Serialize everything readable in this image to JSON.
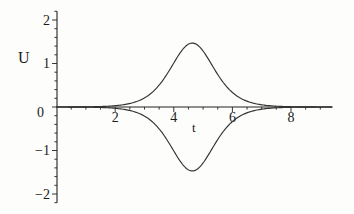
{
  "figure": {
    "background_color": "#fdfdfc",
    "curve_color": "#333333",
    "axis_color": "#222222",
    "text_color": "#1b1b1b"
  },
  "chart_data": {
    "type": "line",
    "title": "",
    "xlabel": "t",
    "ylabel": "U",
    "xlim": [
      0,
      9.4
    ],
    "ylim": [
      -2.2,
      2.2
    ],
    "x_major_ticks": [
      2,
      4,
      6,
      8
    ],
    "y_major_ticks": [
      -2,
      -1,
      0,
      1,
      2
    ],
    "x_minor_step": 0.5,
    "y_minor_step": 0.2,
    "grid": false,
    "legend": "none",
    "series": [
      {
        "name": "upper-pulse",
        "shape": "sech-squared",
        "amplitude": 1.47,
        "center": 4.63,
        "width": 1.0,
        "points": [
          [
            0,
            0.001
          ],
          [
            1,
            0.004
          ],
          [
            2,
            0.03
          ],
          [
            2.5,
            0.081
          ],
          [
            3,
            0.209
          ],
          [
            3.5,
            0.503
          ],
          [
            4,
            1.012
          ],
          [
            4.63,
            1.47
          ],
          [
            5,
            1.285
          ],
          [
            5.5,
            0.747
          ],
          [
            6,
            0.335
          ],
          [
            6.5,
            0.133
          ],
          [
            7,
            0.051
          ],
          [
            7.5,
            0.019
          ],
          [
            8,
            0.007
          ],
          [
            9,
            0.001
          ],
          [
            9.4,
            0.0
          ]
        ]
      },
      {
        "name": "lower-pulse",
        "shape": "sech-squared",
        "amplitude": -1.47,
        "center": 4.63,
        "width": 1.0,
        "points": [
          [
            0,
            -0.001
          ],
          [
            1,
            -0.004
          ],
          [
            2,
            -0.03
          ],
          [
            2.5,
            -0.081
          ],
          [
            3,
            -0.209
          ],
          [
            3.5,
            -0.503
          ],
          [
            4,
            -1.012
          ],
          [
            4.63,
            -1.47
          ],
          [
            5,
            -1.285
          ],
          [
            5.5,
            -0.747
          ],
          [
            6,
            -0.335
          ],
          [
            6.5,
            -0.133
          ],
          [
            7,
            -0.051
          ],
          [
            7.5,
            -0.019
          ],
          [
            8,
            -0.007
          ],
          [
            9,
            -0.001
          ],
          [
            9.4,
            0.0
          ]
        ]
      }
    ]
  }
}
